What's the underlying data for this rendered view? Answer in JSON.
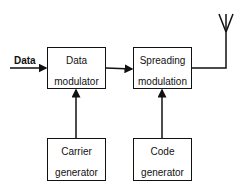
{
  "diagram": {
    "title": "",
    "input_label": "Data",
    "blocks": [
      {
        "id": "data-modulator",
        "line1": "Data",
        "line2": "modulator"
      },
      {
        "id": "spreading-modulation",
        "line1": "Spreading",
        "line2": "modulation"
      },
      {
        "id": "carrier-generator",
        "line1": "Carrier",
        "line2": "generator"
      },
      {
        "id": "code-generator",
        "line1": "Code",
        "line2": "generator"
      }
    ],
    "connections": [
      {
        "from": "input",
        "to": "data-modulator"
      },
      {
        "from": "data-modulator",
        "to": "spreading-modulation"
      },
      {
        "from": "carrier-generator",
        "to": "data-modulator"
      },
      {
        "from": "code-generator",
        "to": "spreading-modulation"
      },
      {
        "from": "spreading-modulation",
        "to": "antenna"
      }
    ],
    "output_icon": "antenna-icon"
  }
}
